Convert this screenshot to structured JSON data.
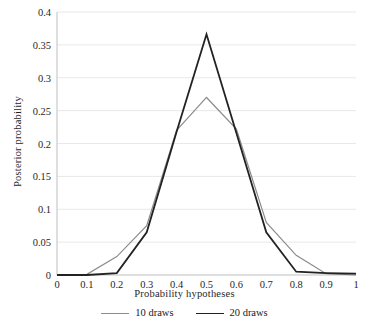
{
  "chart_data": {
    "type": "line",
    "title": "",
    "subtitle": "",
    "xlabel": "Probability hypotheses",
    "ylabel": "Posterior probability",
    "x": [
      0,
      0.1,
      0.2,
      0.3,
      0.4,
      0.5,
      0.6,
      0.7,
      0.8,
      0.9,
      1
    ],
    "xlim": [
      0,
      1
    ],
    "ylim": [
      0,
      0.4
    ],
    "xticks": [
      "0",
      "0.1",
      "0.2",
      "0.3",
      "0.4",
      "0.5",
      "0.6",
      "0.7",
      "0.8",
      "0.9",
      "1"
    ],
    "yticks": [
      "0",
      "0.05",
      "0.1",
      "0.15",
      "0.2",
      "0.25",
      "0.3",
      "0.35",
      "0.4"
    ],
    "ytick_values": [
      0,
      0.05,
      0.1,
      0.15,
      0.2,
      0.25,
      0.3,
      0.35,
      0.4
    ],
    "grid": "horizontal",
    "legend_position": "bottom",
    "series": [
      {
        "name": "10 draws",
        "color": "#8c8c8c",
        "width": 1.2,
        "values": [
          0.0,
          0.001,
          0.028,
          0.075,
          0.22,
          0.27,
          0.222,
          0.08,
          0.03,
          0.002,
          0.0
        ]
      },
      {
        "name": "20 draws",
        "color": "#222222",
        "width": 1.8,
        "values": [
          0.0,
          0.0,
          0.003,
          0.065,
          0.218,
          0.366,
          0.216,
          0.065,
          0.005,
          0.003,
          0.002
        ]
      }
    ]
  },
  "legend": {
    "items": [
      {
        "label": "10 draws",
        "color": "#8c8c8c"
      },
      {
        "label": "20 draws",
        "color": "#222222"
      }
    ]
  },
  "colors": {
    "gridline": "#e8e8e8",
    "axis": "#bfbfbf",
    "text": "#1f1f1f",
    "background": "#ffffff"
  }
}
